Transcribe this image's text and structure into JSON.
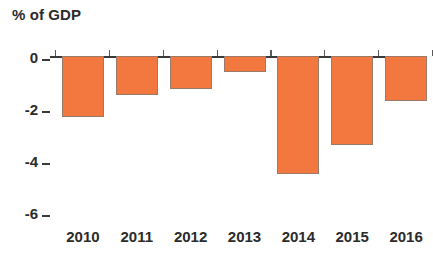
{
  "chart_data": {
    "type": "bar",
    "title": "% of GDP",
    "subtitle": "",
    "xlabel": "",
    "ylabel": "% of GDP",
    "categories": [
      "2010",
      "2011",
      "2012",
      "2013",
      "2014",
      "2015",
      "2016"
    ],
    "values": [
      -2.35,
      -1.5,
      -1.27,
      -0.62,
      -4.55,
      -3.42,
      -1.73
    ],
    "series": [
      {
        "name": "Budget balance",
        "values": [
          -2.35,
          -1.5,
          -1.27,
          -0.62,
          -4.55,
          -3.42,
          -1.73
        ]
      }
    ],
    "ylim": [
      -6.6,
      0.35
    ],
    "ytick_values": [
      0,
      -2,
      -4,
      -6
    ],
    "ytick_labels": [
      "0",
      "-2",
      "-4",
      "-6"
    ],
    "grid": false,
    "legend": false,
    "legend_position": "none",
    "bar_color": "#f2783f",
    "bar_edge_color": "#9a7a68",
    "axis_color": "#3a3a3a",
    "text_color": "#2b2b2b",
    "orientation": "vertical",
    "annotations": []
  },
  "axis": {
    "y_label_0": "0",
    "y_label_1": "-2",
    "y_label_2": "-4",
    "y_label_3": "-6",
    "x_label_0": "2010",
    "x_label_1": "2011",
    "x_label_2": "2012",
    "x_label_3": "2013",
    "x_label_4": "2014",
    "x_label_5": "2015",
    "x_label_6": "2016"
  },
  "header": {
    "title": "% of GDP"
  }
}
